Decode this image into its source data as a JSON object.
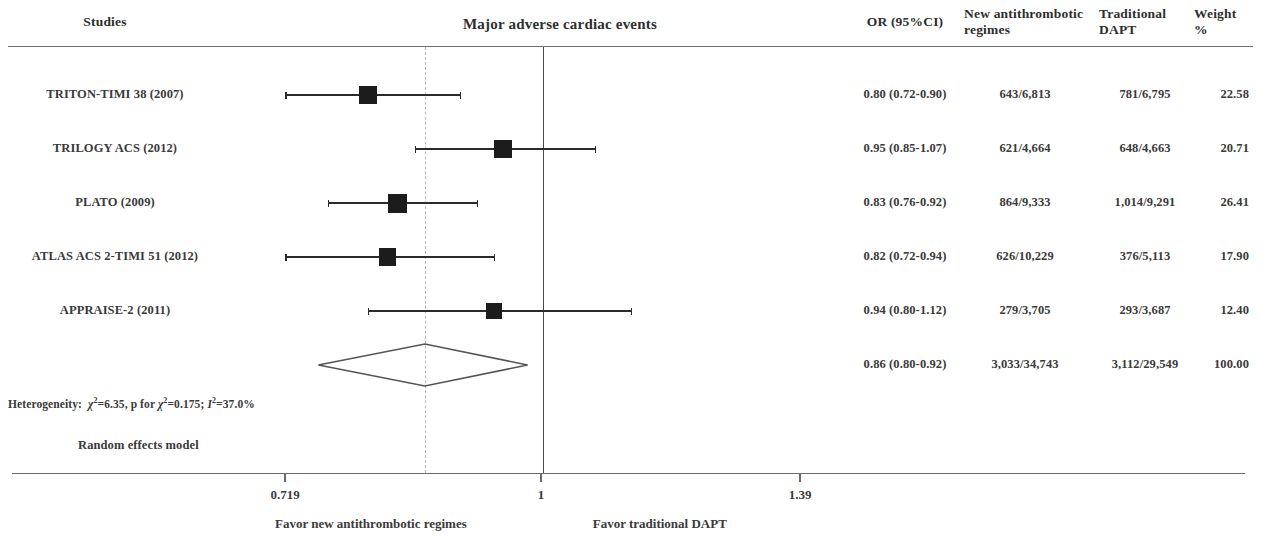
{
  "header": {
    "studies_label": "Studies",
    "plot_title": "Major adverse cardiac events",
    "col_or": "OR (95%CI)",
    "col_new_line1": "New antithrombotic",
    "col_new_line2": "regimes",
    "col_trad_line1": "Traditional",
    "col_trad_line2": "DAPT",
    "col_weight_line1": "Weight",
    "col_weight_line2": "%"
  },
  "footer": {
    "heterogeneity_label": "Heterogeneity:",
    "heterogeneity_chi2": "6.35",
    "heterogeneity_p": "0.175",
    "heterogeneity_i2": "37.0%",
    "model": "Random effects model",
    "favor_left": "Favor new antithrombotic regimes",
    "favor_right": "Favor traditional DAPT"
  },
  "axis": {
    "ticks": [
      "0.719",
      "1",
      "1.39"
    ],
    "tick_values": [
      0.719,
      1,
      1.39
    ],
    "tick_x": [
      285,
      541,
      800
    ],
    "null_value": 1,
    "summary_value": 0.86
  },
  "chart_data": {
    "type": "forest",
    "title": "Major adverse cardiac events",
    "xlabel": "Odds Ratio (log scale)",
    "ylabel": "",
    "xscale": "log",
    "xlim": [
      0.68,
      1.48
    ],
    "grid": false,
    "null_line": 1,
    "columns": [
      "Studies",
      "OR (95%CI)",
      "New antithrombotic regimes",
      "Traditional DAPT",
      "Weight %"
    ],
    "rows": [
      {
        "study": "TRITON-TIMI 38 (2007)",
        "or_text": "0.80 (0.72-0.90)",
        "or": 0.8,
        "ci_low": 0.72,
        "ci_high": 0.9,
        "events_new": "643/6,813",
        "events_trad": "781/6,795",
        "weight": "22.58",
        "weight_value": 22.58
      },
      {
        "study": "TRILOGY ACS (2012)",
        "or_text": "0.95 (0.85-1.07)",
        "or": 0.95,
        "ci_low": 0.85,
        "ci_high": 1.07,
        "events_new": "621/4,664",
        "events_trad": "648/4,663",
        "weight": "20.71",
        "weight_value": 20.71
      },
      {
        "study": "PLATO (2009)",
        "or_text": "0.83 (0.76-0.92)",
        "or": 0.83,
        "ci_low": 0.76,
        "ci_high": 0.92,
        "events_new": "864/9,333",
        "events_trad": "1,014/9,291",
        "weight": "26.41",
        "weight_value": 26.41
      },
      {
        "study": "ATLAS ACS 2-TIMI 51 (2012)",
        "or_text": "0.82 (0.72-0.94)",
        "or": 0.82,
        "ci_low": 0.72,
        "ci_high": 0.94,
        "events_new": "626/10,229",
        "events_trad": "376/5,113",
        "weight": "17.90",
        "weight_value": 17.9
      },
      {
        "study": "APPRAISE-2 (2011)",
        "or_text": "0.94 (0.80-1.12)",
        "or": 0.94,
        "ci_low": 0.8,
        "ci_high": 1.12,
        "events_new": "279/3,705",
        "events_trad": "293/3,687",
        "weight": "12.40",
        "weight_value": 12.4
      }
    ],
    "summary": {
      "study": "",
      "or_text": "0.86 (0.80-0.92)",
      "or": 0.86,
      "ci_low": 0.8,
      "ci_high": 0.92,
      "events_new": "3,033/34,743",
      "events_trad": "3,112/29,549",
      "weight": "100.00",
      "weight_value": 100.0
    },
    "heterogeneity": "Heterogeneity: χ²=6.35, p for χ²=0.175; I²=37.0%",
    "model": "Random effects model"
  }
}
